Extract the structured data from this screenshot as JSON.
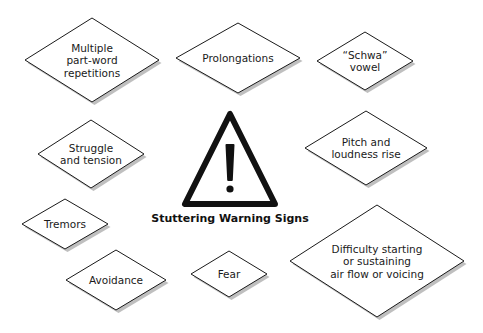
{
  "title": "Stuttering Warning Signs",
  "colors": {
    "stroke": "#1a1a1a",
    "fill": "#ffffff",
    "shadow": "#8a8a8a",
    "text": "#1a1a1a"
  },
  "central_icon": "warning-triangle-icon",
  "nodes": [
    {
      "id": "multiple-part-word-repetitions",
      "lines": [
        "Multiple",
        "part-word",
        "repetitions"
      ],
      "cx": 92,
      "cy": 60,
      "w": 134,
      "h": 84
    },
    {
      "id": "prolongations",
      "lines": [
        "Prolongations"
      ],
      "cx": 238,
      "cy": 58,
      "w": 124,
      "h": 70
    },
    {
      "id": "schwa-vowel",
      "lines": [
        "“Schwa”",
        "vowel"
      ],
      "cx": 365,
      "cy": 61,
      "w": 96,
      "h": 58
    },
    {
      "id": "struggle-and-tension",
      "lines": [
        "Struggle",
        "and tension"
      ],
      "cx": 91,
      "cy": 154,
      "w": 106,
      "h": 68
    },
    {
      "id": "pitch-and-loudness-rise",
      "lines": [
        "Pitch and",
        "loudness rise"
      ],
      "cx": 366,
      "cy": 148,
      "w": 122,
      "h": 74
    },
    {
      "id": "tremors",
      "lines": [
        "Tremors"
      ],
      "cx": 65,
      "cy": 224,
      "w": 86,
      "h": 50
    },
    {
      "id": "avoidance",
      "lines": [
        "Avoidance"
      ],
      "cx": 116,
      "cy": 280,
      "w": 100,
      "h": 60
    },
    {
      "id": "fear",
      "lines": [
        "Fear"
      ],
      "cx": 229,
      "cy": 274,
      "w": 76,
      "h": 46
    },
    {
      "id": "difficulty-starting-or-sustaining-air-flow-or-voicing",
      "lines": [
        "Difficulty starting",
        "or sustaining",
        "air flow or voicing"
      ],
      "cx": 377,
      "cy": 261,
      "w": 174,
      "h": 112
    }
  ]
}
